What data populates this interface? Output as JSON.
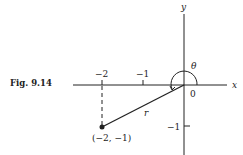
{
  "figure": {
    "caption": "Fig. 9.14",
    "axes": {
      "x_label": "x",
      "y_label": "y",
      "origin_label": "0"
    },
    "ticks": {
      "x": [
        "−2",
        "−1"
      ],
      "y": [
        "−1"
      ]
    },
    "point": {
      "label": "(−2, −1)",
      "x": -2,
      "y": -1
    },
    "radius_label": "r",
    "angle_label": "θ"
  }
}
